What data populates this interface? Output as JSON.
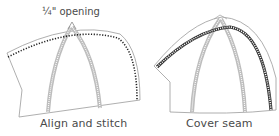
{
  "panels": [
    {
      "id": "left",
      "caption": "Align and stitch",
      "annotation": "¼\" opening",
      "stitch_style": "dotted"
    },
    {
      "id": "right",
      "caption": "Cover seam",
      "stitch_style": "double-dotted band"
    }
  ],
  "colors": {
    "outline": "#9a9a9a",
    "seam_band": "#b8b8b8",
    "stitch": "#222222",
    "text": "#4a4a4a"
  }
}
